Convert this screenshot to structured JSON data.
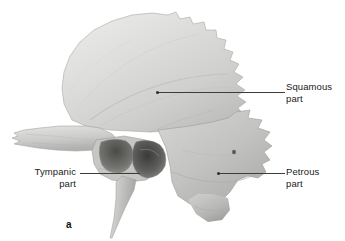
{
  "figure": {
    "caption_letter": "a",
    "background_color": "#ffffff",
    "specimen": "temporal-bone-lateral-view",
    "leader_line_color": "#3c3c3c",
    "label_text_color": "#1b1b1b"
  },
  "labels": {
    "squamous": {
      "line1": "Squamous",
      "line2": "part"
    },
    "tympanic": {
      "line1": "Tympanic",
      "line2": "part"
    },
    "petrous": {
      "line1": "Petrous",
      "line2": "part"
    }
  }
}
